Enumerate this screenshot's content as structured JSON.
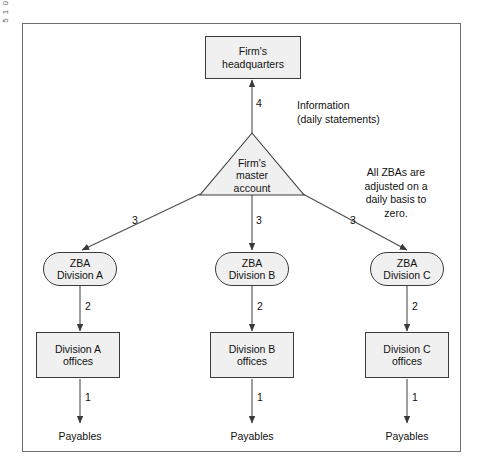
{
  "figure": {
    "nodes": {
      "headquarters": "Firm's\nheadquarters",
      "master_account": "Firm's\nmaster\naccount",
      "zba_a": "ZBA\nDivision A",
      "zba_b": "ZBA\nDivision B",
      "zba_c": "ZBA\nDivision C",
      "offices_a": "Division A\noffices",
      "offices_b": "Division B\noffices",
      "offices_c": "Division C\noffices",
      "payables_a": "Payables",
      "payables_b": "Payables",
      "payables_c": "Payables"
    },
    "edge_labels": {
      "hq_from_master": "4",
      "master_to_zba_a": "3",
      "master_to_zba_b": "3",
      "master_to_zba_c": "3",
      "zba_a_to_offices": "2",
      "zba_b_to_offices": "2",
      "zba_c_to_offices": "2",
      "offices_a_to_payables": "1",
      "offices_b_to_payables": "1",
      "offices_c_to_payables": "1"
    },
    "annotations": {
      "information": "Information\n(daily statements)",
      "zba_note": "All ZBAs are\nadjusted on a\ndaily basis to\nzero."
    },
    "colors": {
      "node_fill": "#f0f0f0",
      "node_stroke": "#3a3a3a",
      "line": "#4d4d4d",
      "frame": "#6e6e6e",
      "text": "#111111",
      "background": "#ffffff"
    }
  }
}
